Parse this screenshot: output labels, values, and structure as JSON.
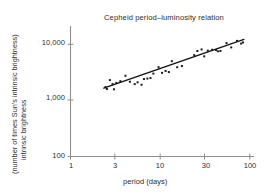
{
  "chart_data": {
    "type": "scatter",
    "title": "Cepheid period–luminosity relation",
    "xlabel": "period (days)",
    "ylabel_line1": "intrinsic brightness",
    "ylabel_line2": "(number of times Sun's intrinsic brightness)",
    "xscale": "log",
    "yscale": "log",
    "xlim": [
      1,
      100
    ],
    "ylim": [
      100,
      20000
    ],
    "xticks": [
      1,
      3,
      10,
      30,
      100
    ],
    "xtick_labels": [
      "1",
      "3",
      "10",
      "30",
      "100"
    ],
    "yticks": [
      100,
      1000,
      10000
    ],
    "ytick_labels": [
      "100",
      "1,000",
      "10,000"
    ],
    "grid": false,
    "legend": "none",
    "marker": "square",
    "marker_color": "#1a1a1a",
    "line_color": "#101010",
    "axis_color": "#8a8a8a",
    "background": "#ffffff",
    "points": [
      {
        "period": 2.45,
        "brightness": 1720
      },
      {
        "period": 2.55,
        "brightness": 1600
      },
      {
        "period": 2.75,
        "brightness": 2300
      },
      {
        "period": 2.95,
        "brightness": 1950
      },
      {
        "period": 3.05,
        "brightness": 1580
      },
      {
        "period": 3.25,
        "brightness": 2050
      },
      {
        "period": 3.6,
        "brightness": 2200
      },
      {
        "period": 4.1,
        "brightness": 2750
      },
      {
        "period": 4.6,
        "brightness": 2150
      },
      {
        "period": 5.2,
        "brightness": 1950
      },
      {
        "period": 5.6,
        "brightness": 2100
      },
      {
        "period": 6.2,
        "brightness": 1900
      },
      {
        "period": 6.6,
        "brightness": 2400
      },
      {
        "period": 7.2,
        "brightness": 2450
      },
      {
        "period": 7.8,
        "brightness": 2500
      },
      {
        "period": 8.4,
        "brightness": 3000
      },
      {
        "period": 9.6,
        "brightness": 3900
      },
      {
        "period": 10.5,
        "brightness": 3100
      },
      {
        "period": 11.5,
        "brightness": 3350
      },
      {
        "period": 12.5,
        "brightness": 3200
      },
      {
        "period": 13.5,
        "brightness": 5000
      },
      {
        "period": 15.5,
        "brightness": 3900
      },
      {
        "period": 17.5,
        "brightness": 4100
      },
      {
        "period": 24.0,
        "brightness": 6400
      },
      {
        "period": 26.0,
        "brightness": 7600
      },
      {
        "period": 29.0,
        "brightness": 8100
      },
      {
        "period": 31.0,
        "brightness": 6100
      },
      {
        "period": 34.0,
        "brightness": 7700
      },
      {
        "period": 38.0,
        "brightness": 8000
      },
      {
        "period": 42.0,
        "brightness": 7900
      },
      {
        "period": 44.0,
        "brightness": 7500
      },
      {
        "period": 47.0,
        "brightness": 7600
      },
      {
        "period": 55.0,
        "brightness": 10500
      },
      {
        "period": 62.0,
        "brightness": 8800
      },
      {
        "period": 72.0,
        "brightness": 11500
      },
      {
        "period": 80.0,
        "brightness": 10300
      },
      {
        "period": 84.0,
        "brightness": 10800
      }
    ],
    "trendline": {
      "x_start": 2.35,
      "y_start": 1650,
      "x_end": 86.0,
      "y_end": 12200
    }
  }
}
